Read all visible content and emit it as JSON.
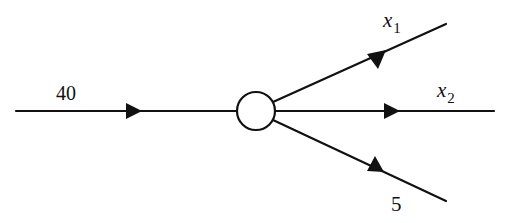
{
  "diagram": {
    "type": "flow-network-node",
    "node": {
      "id": "junction",
      "shape": "circle"
    },
    "edges": [
      {
        "id": "inflow",
        "direction": "in",
        "label": "40",
        "value": 40
      },
      {
        "id": "out-x1",
        "direction": "out",
        "label_var": "x",
        "label_sub": "1"
      },
      {
        "id": "out-x2",
        "direction": "out",
        "label_var": "x",
        "label_sub": "2"
      },
      {
        "id": "out-5",
        "direction": "out",
        "label": "5",
        "value": 5
      }
    ],
    "colors": {
      "stroke": "#111111",
      "background": "#ffffff"
    }
  }
}
